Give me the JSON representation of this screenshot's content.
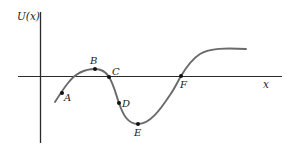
{
  "diagram": {
    "y_axis_label": "U(x)",
    "x_axis_label": "x",
    "colors": {
      "axis": "#2a2a2a",
      "curve": "#6a6a6a",
      "point": "#111111",
      "text": "#222222"
    },
    "points": [
      {
        "name": "A",
        "x": 62,
        "y": 93
      },
      {
        "name": "B",
        "x": 95,
        "y": 69
      },
      {
        "name": "C",
        "x": 109,
        "y": 77
      },
      {
        "name": "D",
        "x": 119,
        "y": 103
      },
      {
        "name": "E",
        "x": 138,
        "y": 124
      },
      {
        "name": "F",
        "x": 181,
        "y": 76
      }
    ],
    "labels": {
      "A": "A",
      "B": "B",
      "C": "C",
      "D": "D",
      "E": "E",
      "F": "F"
    }
  }
}
